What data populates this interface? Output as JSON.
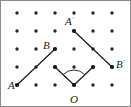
{
  "figure": {
    "width": 131,
    "height": 107,
    "background_color": "#ffffff",
    "border_color": "#8a8a8a",
    "ink_color": "#1a1a1a",
    "dot_color": "#262626"
  },
  "grid": {
    "columns": 6,
    "rows": 5,
    "x_start": 17,
    "y_start": 13,
    "x_spacing": 19,
    "y_spacing": 18,
    "dot_radius": 1.7,
    "dot_count": 30
  },
  "points": {
    "A": {
      "label": "A",
      "prime": "",
      "x": 17,
      "y": 85,
      "label_x": 8,
      "label_y": 89
    },
    "B": {
      "label": "B",
      "prime": "",
      "x": 55,
      "y": 49,
      "label_x": 43,
      "label_y": 49
    },
    "A_prime": {
      "label": "A",
      "prime": "'",
      "x": 74,
      "y": 31,
      "label_x": 65,
      "label_y": 25
    },
    "B_prime": {
      "label": "B",
      "prime": "'",
      "x": 112,
      "y": 67,
      "label_x": 116,
      "label_y": 68
    },
    "O": {
      "label": "O",
      "prime": "",
      "x": 74,
      "y": 85,
      "label_x": 70,
      "label_y": 103
    },
    "ray_left_end": {
      "x": 55,
      "y": 67
    },
    "ray_right_end": {
      "x": 93,
      "y": 67
    }
  },
  "segments": [
    {
      "name": "segment-AB",
      "from": "A",
      "to": "B",
      "x1": 17,
      "y1": 85,
      "x2": 55,
      "y2": 49
    },
    {
      "name": "segment-A'B'",
      "from": "A_prime",
      "to": "B_prime",
      "x1": 74,
      "y1": 31,
      "x2": 112,
      "y2": 67
    },
    {
      "name": "ray-O-left",
      "from": "O",
      "to": "ray_left_end",
      "x1": 74,
      "y1": 85,
      "x2": 55,
      "y2": 67
    },
    {
      "name": "ray-O-right",
      "from": "O",
      "to": "ray_right_end",
      "x1": 74,
      "y1": 85,
      "x2": 93,
      "y2": 67
    }
  ],
  "angle_arc": {
    "name": "angle-arc-at-O",
    "vertex_x": 74,
    "vertex_y": 85,
    "radius": 15,
    "path": "M 63.4 74.4 A 15 15 0 0 1 84.6 74.4"
  },
  "line_width": 1.2
}
